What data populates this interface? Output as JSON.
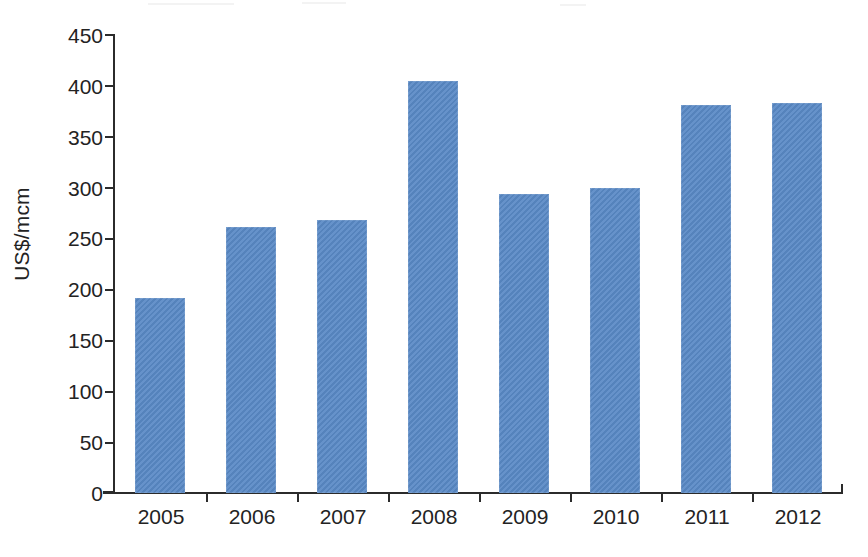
{
  "chart_data": {
    "type": "bar",
    "title": "",
    "subtitle": "",
    "xlabel": "",
    "ylabel": "US$/mcm",
    "categories": [
      "2005",
      "2006",
      "2007",
      "2008",
      "2009",
      "2010",
      "2011",
      "2012"
    ],
    "values": [
      192,
      261,
      268,
      405,
      294,
      300,
      381,
      383
    ],
    "series": [
      {
        "name": "",
        "values": [
          192,
          261,
          268,
          405,
          294,
          300,
          381,
          383
        ]
      }
    ],
    "ylim": [
      0,
      450
    ],
    "ytick_values": [
      0,
      50,
      100,
      150,
      200,
      250,
      300,
      350,
      400,
      450
    ],
    "ytick_labels": [
      "0",
      "50",
      "100",
      "150",
      "200",
      "250",
      "300",
      "350",
      "400",
      "450"
    ],
    "y_tick_step": 50,
    "grid": false,
    "legend": false,
    "legend_position": "none",
    "bar_color": "#5a8ac6",
    "axis_color": "#2b2b2b",
    "text_color": "#232323",
    "background_color": "#ffffff",
    "orientation": "vertical"
  }
}
